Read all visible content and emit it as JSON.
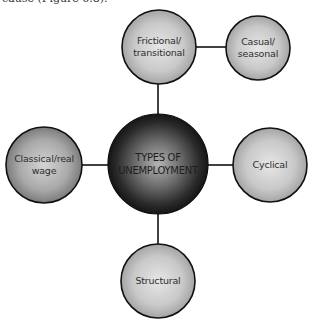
{
  "caption": "cause (Figure 6.8).",
  "diagram": {
    "title": "Types of unemployment",
    "center": {
      "lines": [
        "TYPES OF",
        "UNEMPLOYMENT"
      ]
    },
    "nodes": [
      {
        "id": "frictional",
        "lines": [
          "Frictional/",
          "transitional"
        ]
      },
      {
        "id": "casual",
        "lines": [
          "Casual/",
          "seasonal"
        ]
      },
      {
        "id": "classical",
        "lines": [
          "Classical/real",
          "wage"
        ]
      },
      {
        "id": "cyclical",
        "lines": [
          "Cyclical"
        ]
      },
      {
        "id": "structural",
        "lines": [
          "Structural"
        ]
      }
    ],
    "colors": {
      "line": "#111111",
      "node_light": "#e2e2e2",
      "node_dark": "#9a9a9a",
      "center_light": "#b0b0b0",
      "center_dark": "#141414"
    }
  }
}
